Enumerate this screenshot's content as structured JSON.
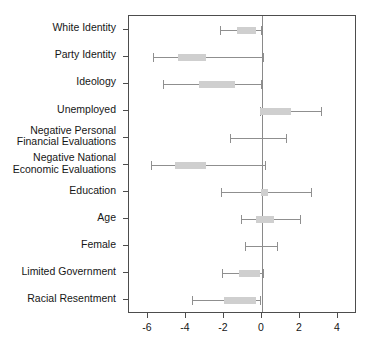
{
  "chart_data": {
    "type": "dot_ci",
    "title": "",
    "xlabel": "",
    "ylabel": "",
    "xlim": [
      -7,
      5
    ],
    "xticks": [
      -6,
      -4,
      -2,
      0,
      2,
      4
    ],
    "xtick_labels": [
      "-6",
      "-4",
      "-2",
      "0",
      "2",
      "4"
    ],
    "grid": false,
    "legend": "none",
    "zero_reference_line": 0,
    "colors": {
      "bar_fill": "#cfcfcf",
      "whisker": "#8f8f8f",
      "axis": "#4d4d4d",
      "zero_line": "#8a8a8a",
      "background": "#ffffff"
    },
    "categories": [
      "White Identity",
      "Party Identity",
      "Ideology",
      "Unemployed",
      "Negative Personal\nFinancial Evaluations",
      "Negative National\nEconomic Evaluations",
      "Education",
      "Age",
      "Female",
      "Limited Government",
      "Racial Resentment"
    ],
    "points": [
      {
        "label": "White Identity",
        "outer_low": -2.2,
        "outer_high": -0.05,
        "inner_low": -1.3,
        "inner_high": -0.3
      },
      {
        "label": "Party Identity",
        "outer_low": -5.75,
        "outer_high": 0.05,
        "inner_low": -4.4,
        "inner_high": -2.95
      },
      {
        "label": "Ideology",
        "outer_low": -5.2,
        "outer_high": -0.05,
        "inner_low": -3.3,
        "inner_high": -1.4
      },
      {
        "label": "Unemployed",
        "outer_low": -0.1,
        "outer_high": 3.1,
        "inner_low": -0.1,
        "inner_high": 1.55
      },
      {
        "label": "Negative Personal Financial Evaluations",
        "outer_low": -1.7,
        "outer_high": 1.25,
        "inner_low": null,
        "inner_high": null
      },
      {
        "label": "Negative National Economic Evaluations",
        "outer_low": -5.85,
        "outer_high": 0.15,
        "inner_low": -4.6,
        "inner_high": -2.95
      },
      {
        "label": "Education",
        "outer_low": -2.15,
        "outer_high": 2.6,
        "inner_low": -0.05,
        "inner_high": 0.3
      },
      {
        "label": "Age",
        "outer_low": -1.1,
        "outer_high": 2.0,
        "inner_low": -0.3,
        "inner_high": 0.65
      },
      {
        "label": "Female",
        "outer_low": -0.9,
        "outer_high": 0.8,
        "inner_low": null,
        "inner_high": null
      },
      {
        "label": "Limited Government",
        "outer_low": -2.1,
        "outer_high": 0.05,
        "inner_low": -1.2,
        "inner_high": -0.1
      },
      {
        "label": "Racial Resentment",
        "outer_low": -3.7,
        "outer_high": -0.1,
        "inner_low": -2.0,
        "inner_high": -0.3
      }
    ]
  }
}
